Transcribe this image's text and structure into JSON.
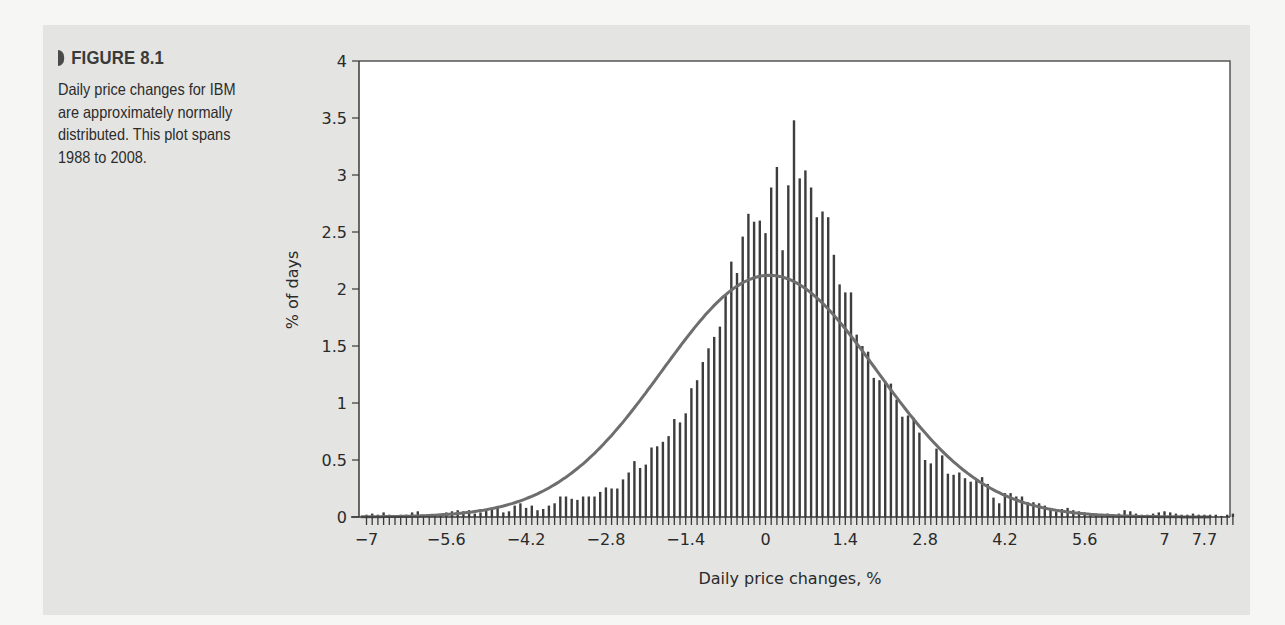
{
  "figure": {
    "label": "FIGURE 8.1",
    "caption": "Daily price changes for IBM are approximately normally distributed. This plot spans 1988 to 2008."
  },
  "colors": {
    "page_background": "#f6f6f4",
    "panel_background": "#e4e4e2",
    "plot_background": "#ffffff",
    "bars": "#3d3d3d",
    "normal_curve": "#6e6e6e",
    "axis": "#3a3a3a"
  },
  "chart_data": {
    "type": "bar",
    "title": "",
    "xlabel": "Daily price changes, %",
    "ylabel": "% of days",
    "xlim": [
      -7.15,
      7.85
    ],
    "ylim": [
      0,
      4
    ],
    "grid": false,
    "legend": "none",
    "x_ticks": [
      "-7",
      "-5.6",
      "-4.2",
      "-2.8",
      "-1.4",
      "0",
      "1.4",
      "2.8",
      "4.2",
      "5.6",
      "7",
      "7.7"
    ],
    "x_tick_values": [
      -7,
      -5.6,
      -4.2,
      -2.8,
      -1.4,
      0,
      1.4,
      2.8,
      4.2,
      5.6,
      7,
      7.7
    ],
    "y_ticks": [
      "0",
      "0.5",
      "1",
      "1.5",
      "2",
      "2.5",
      "3",
      "3.5",
      "4"
    ],
    "y_tick_values": [
      0,
      0.5,
      1,
      1.5,
      2,
      2.5,
      3,
      3.5,
      4
    ],
    "bin_start": -7.0,
    "bin_width": 0.1,
    "series": [
      {
        "name": "Observed daily price changes (histogram)",
        "values": [
          0.02,
          0.03,
          0.02,
          0.04,
          0.02,
          0.01,
          0.02,
          0.02,
          0.04,
          0.05,
          0.02,
          0.01,
          0.02,
          0.02,
          0.04,
          0.05,
          0.06,
          0.05,
          0.06,
          0.03,
          0.04,
          0.07,
          0.07,
          0.08,
          0.04,
          0.05,
          0.1,
          0.12,
          0.08,
          0.1,
          0.06,
          0.07,
          0.1,
          0.12,
          0.18,
          0.18,
          0.16,
          0.15,
          0.18,
          0.18,
          0.18,
          0.22,
          0.26,
          0.25,
          0.25,
          0.33,
          0.39,
          0.49,
          0.43,
          0.46,
          0.61,
          0.62,
          0.66,
          0.71,
          0.86,
          0.83,
          0.91,
          1.13,
          1.2,
          1.36,
          1.48,
          1.58,
          1.67,
          1.95,
          2.24,
          2.14,
          2.46,
          2.66,
          2.59,
          2.6,
          2.49,
          2.89,
          3.07,
          2.34,
          2.91,
          3.48,
          2.97,
          3.04,
          2.89,
          2.63,
          2.68,
          2.63,
          2.3,
          2.04,
          1.97,
          1.97,
          1.6,
          1.5,
          1.45,
          1.22,
          1.2,
          1.19,
          1.17,
          1.03,
          0.88,
          0.89,
          0.87,
          0.74,
          0.5,
          0.47,
          0.6,
          0.54,
          0.38,
          0.37,
          0.39,
          0.34,
          0.31,
          0.33,
          0.35,
          0.29,
          0.17,
          0.12,
          0.21,
          0.21,
          0.18,
          0.18,
          0.13,
          0.13,
          0.12,
          0.1,
          0.07,
          0.05,
          0.07,
          0.08,
          0.06,
          0.05,
          0.04,
          0.03,
          0.03,
          0.02,
          0.03,
          0.02,
          0.03,
          0.06,
          0.05,
          0.03,
          0.02,
          0.02,
          0.03,
          0.04,
          0.05,
          0.04,
          0.03,
          0.02,
          0.02,
          0.03,
          0.02,
          0.02,
          0.02,
          0.02,
          0.01,
          0.02,
          0.03
        ]
      },
      {
        "name": "Normal distribution fit",
        "type": "line",
        "mean": 0.07,
        "std_dev": 1.88,
        "peak": 2.12
      }
    ]
  }
}
